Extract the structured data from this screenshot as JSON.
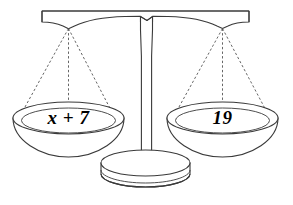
{
  "figure": {
    "type": "balance-scale-diagram",
    "background_color": "#ffffff",
    "line_color": "#3a3a3a",
    "text_color": "#000000"
  },
  "balance": {
    "state": "level",
    "left_pan": {
      "label": "x + 7",
      "position": "left"
    },
    "right_pan": {
      "label": "19",
      "position": "right"
    },
    "equation": "x + 7 = 19"
  },
  "parts": {
    "beam": "beam",
    "post": "post",
    "base": "base",
    "left_strings": "left-strings",
    "right_strings": "right-strings"
  }
}
